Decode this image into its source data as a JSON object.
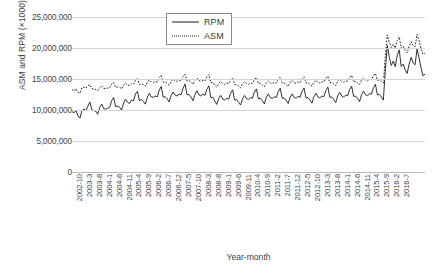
{
  "chart_data": {
    "type": "line",
    "title": "",
    "xlabel": "Year-month",
    "ylabel": "ASM and RPM (×1000)",
    "ylim": [
      0,
      25000000
    ],
    "ytick_labels": [
      "25,000,000",
      "20,000,000",
      "15,000,000",
      "10,000,000",
      "5,000,000",
      "0"
    ],
    "ytick_values": [
      25000000,
      20000000,
      15000000,
      10000000,
      5000000,
      0
    ],
    "grid": true,
    "legend_position": "top-center",
    "x_start": "2002-10",
    "x_end": "2016-7",
    "x_tick_step_months": 5,
    "xtick_labels": [
      "2002-10",
      "2003-3",
      "2003-8",
      "2004-1",
      "2004-6",
      "2004-11",
      "2005-4",
      "2005-9",
      "2006-2",
      "2006-7",
      "2006-12",
      "2007-5",
      "2007-10",
      "2008-3",
      "2008-8",
      "2009-1",
      "2009-6",
      "2009-11",
      "2010-4",
      "2010-9",
      "2011-2",
      "2011-7",
      "2011-12",
      "2012-5",
      "2012-10",
      "2013-3",
      "2013-8",
      "2014-1",
      "2014-6",
      "2014-11",
      "2015-4",
      "2015-9",
      "2016-2",
      "2016-7"
    ],
    "series": [
      {
        "name": "RPM",
        "style": "solid",
        "color": "#1a1a1a",
        "values": [
          9750000,
          9550000,
          9900000,
          9050000,
          8700000,
          9850000,
          10150000,
          9900000,
          10600000,
          11300000,
          10050000,
          9900000,
          9800000,
          9300000,
          10400000,
          10950000,
          10200000,
          10150000,
          10300000,
          10450000,
          11500000,
          12000000,
          10550000,
          10600000,
          10450000,
          10000000,
          11100000,
          11750000,
          11250000,
          11050000,
          11600000,
          11500000,
          12600000,
          13000000,
          11500000,
          11700000,
          11400000,
          10950000,
          12050000,
          12700000,
          12100000,
          12050000,
          12250000,
          12100000,
          13200000,
          13800000,
          12050000,
          12150000,
          11800000,
          11300000,
          12350000,
          12900000,
          12400000,
          12250000,
          12600000,
          12450000,
          13500000,
          14200000,
          12450000,
          12500000,
          12100000,
          11500000,
          12500000,
          13100000,
          12450000,
          12250000,
          12550000,
          12350000,
          13350000,
          13900000,
          12000000,
          12050000,
          11450000,
          10900000,
          11850000,
          12350000,
          11750000,
          11600000,
          11900000,
          11750000,
          12700000,
          13250000,
          11600000,
          11700000,
          11250000,
          10800000,
          11800000,
          12350000,
          11800000,
          11700000,
          12000000,
          11900000,
          12900000,
          13400000,
          11800000,
          11900000,
          11500000,
          11000000,
          12050000,
          12600000,
          12000000,
          11850000,
          12150000,
          12000000,
          13000000,
          13500000,
          11900000,
          11950000,
          11550000,
          11050000,
          12050000,
          12600000,
          12050000,
          11900000,
          12200000,
          12050000,
          13050000,
          13550000,
          11950000,
          12000000,
          11600000,
          11100000,
          12150000,
          12700000,
          12100000,
          11950000,
          12250000,
          12150000,
          13150000,
          13700000,
          12050000,
          12100000,
          11700000,
          11200000,
          12300000,
          12850000,
          12250000,
          12100000,
          12400000,
          12300000,
          13300000,
          13850000,
          12200000,
          12250000,
          11850000,
          11350000,
          12500000,
          13050000,
          12450000,
          12300000,
          12650000,
          12550000,
          13600000,
          14150000,
          12450000,
          12500000,
          12100000,
          11600000,
          16500000,
          20400000,
          18500000,
          17200000,
          17900000,
          17000000,
          18800000,
          19700000,
          17000000,
          17400000,
          16500000,
          15900000,
          17400000,
          18500000,
          17600000,
          17300000,
          19800000,
          18400000,
          16800000,
          15500000,
          15800000
        ]
      },
      {
        "name": "ASM",
        "style": "dotted",
        "color": "#1a1a1a",
        "values": [
          13300000,
          13050000,
          13450000,
          12900000,
          12700000,
          13550000,
          13700000,
          13500000,
          13900000,
          14100000,
          13450000,
          13350000,
          13300000,
          13100000,
          13600000,
          13900000,
          13500000,
          13450000,
          13550000,
          13600000,
          14200000,
          14450000,
          13650000,
          13700000,
          13700000,
          13400000,
          14000000,
          14350000,
          14050000,
          13950000,
          14250000,
          14150000,
          14800000,
          15050000,
          14100000,
          14200000,
          14100000,
          13850000,
          14500000,
          14850000,
          14500000,
          14450000,
          14600000,
          14500000,
          15250000,
          15600000,
          14500000,
          14550000,
          14300000,
          14000000,
          14650000,
          15000000,
          14700000,
          14600000,
          14800000,
          14700000,
          15400000,
          15800000,
          14700000,
          14750000,
          14500000,
          14150000,
          14800000,
          15150000,
          14750000,
          14600000,
          14800000,
          14700000,
          15350000,
          15700000,
          14400000,
          14450000,
          14000000,
          13700000,
          14300000,
          14600000,
          14250000,
          14150000,
          14350000,
          14250000,
          14850000,
          15200000,
          14100000,
          14150000,
          13850000,
          13600000,
          14250000,
          14550000,
          14250000,
          14150000,
          14350000,
          14300000,
          14900000,
          15250000,
          14250000,
          14300000,
          14000000,
          13750000,
          14400000,
          14700000,
          14350000,
          14250000,
          14450000,
          14350000,
          14950000,
          15300000,
          14300000,
          14350000,
          14050000,
          13800000,
          14450000,
          14750000,
          14400000,
          14300000,
          14500000,
          14400000,
          15000000,
          15350000,
          14350000,
          14400000,
          14100000,
          13850000,
          14500000,
          14800000,
          14450000,
          14350000,
          14550000,
          14500000,
          15100000,
          15450000,
          14400000,
          14450000,
          14200000,
          13950000,
          14650000,
          14950000,
          14600000,
          14500000,
          14700000,
          14650000,
          15250000,
          15600000,
          14550000,
          14600000,
          14350000,
          14100000,
          14850000,
          15150000,
          14800000,
          14700000,
          14950000,
          14900000,
          15550000,
          15900000,
          14800000,
          14850000,
          14600000,
          14350000,
          18800000,
          22100000,
          20900000,
          20100000,
          20600000,
          20000000,
          21200000,
          21800000,
          20000000,
          20300000,
          19600000,
          19200000,
          20300000,
          21000000,
          20400000,
          20200000,
          22200000,
          21200000,
          19900000,
          19000000,
          19200000
        ]
      }
    ]
  },
  "legend": {
    "items": [
      {
        "label": "RPM",
        "style": "solid"
      },
      {
        "label": "ASM",
        "style": "dotted"
      }
    ]
  }
}
